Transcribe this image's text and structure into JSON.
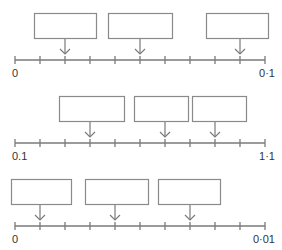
{
  "colors": {
    "line": "#7a7a7a",
    "box": "#8a8a8a",
    "text": "#333333"
  },
  "number_lines": [
    {
      "id": "line-1",
      "start_label": "0",
      "end_label": "0·1",
      "tick_count": 11,
      "arrow_ticks": [
        2,
        5,
        9
      ],
      "y": 60,
      "x_start": 15,
      "x_end": 265,
      "label_y": 68,
      "boxes": [
        {
          "x": 34,
          "y": 13,
          "w": 62,
          "h": 25,
          "value": ""
        },
        {
          "x": 108,
          "y": 13,
          "w": 64,
          "h": 25,
          "value": ""
        },
        {
          "x": 206,
          "y": 13,
          "w": 62,
          "h": 25,
          "value": ""
        }
      ]
    },
    {
      "id": "line-2",
      "start_label": "0.1",
      "end_label": "1·1",
      "tick_count": 11,
      "arrow_ticks": [
        3,
        6,
        8
      ],
      "y": 143,
      "x_start": 15,
      "x_end": 265,
      "label_y": 151,
      "boxes": [
        {
          "x": 59,
          "y": 96,
          "w": 65,
          "h": 25,
          "value": ""
        },
        {
          "x": 134,
          "y": 96,
          "w": 54,
          "h": 25,
          "value": ""
        },
        {
          "x": 192,
          "y": 96,
          "w": 54,
          "h": 25,
          "value": ""
        }
      ]
    },
    {
      "id": "line-3",
      "start_label": "0",
      "end_label": "0·01",
      "tick_count": 11,
      "arrow_ticks": [
        1,
        4,
        7
      ],
      "y": 226,
      "x_start": 15,
      "x_end": 265,
      "label_y": 234,
      "boxes": [
        {
          "x": 11,
          "y": 179,
          "w": 60,
          "h": 25,
          "value": ""
        },
        {
          "x": 85,
          "y": 179,
          "w": 63,
          "h": 25,
          "value": ""
        },
        {
          "x": 158,
          "y": 179,
          "w": 62,
          "h": 25,
          "value": ""
        }
      ]
    }
  ]
}
